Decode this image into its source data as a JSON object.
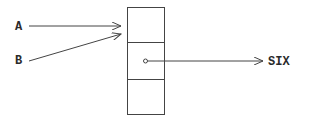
{
  "diagram": {
    "pointers": [
      {
        "label": "A",
        "target": "cell-0"
      },
      {
        "label": "B",
        "target": "cell-0"
      }
    ],
    "cells": [
      "",
      "",
      ""
    ],
    "cell_pointer": {
      "from_cell": 1,
      "label": "SIX"
    },
    "colors": {
      "line": "#444444",
      "text": "#2a2a2a",
      "background": "#ffffff"
    }
  }
}
